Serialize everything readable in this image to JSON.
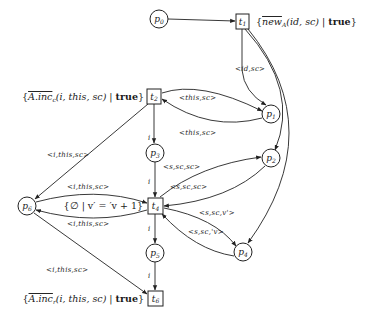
{
  "diagram": {
    "type": "petri-net",
    "places": [
      {
        "id": "p0",
        "label": "p0",
        "sub": "0"
      },
      {
        "id": "p1",
        "label": "p1",
        "sub": "1"
      },
      {
        "id": "p2",
        "label": "p2",
        "sub": "2"
      },
      {
        "id": "p3",
        "label": "p3",
        "sub": "3"
      },
      {
        "id": "p4",
        "label": "p4",
        "sub": "4"
      },
      {
        "id": "p5",
        "label": "p5",
        "sub": "5"
      },
      {
        "id": "p6",
        "label": "p6",
        "sub": "6"
      }
    ],
    "transitions": [
      {
        "id": "t1",
        "sub": "1",
        "guard_pre": "{",
        "guard_name": "new",
        "guard_sub": "A",
        "guard_args": "(id, sc) | ",
        "guard_bool": "true",
        "guard_post": "}"
      },
      {
        "id": "t2",
        "sub": "2",
        "guard_pre": "{",
        "guard_name": "A.inc",
        "guard_sub": "c",
        "guard_args": "(i, this, sc) | ",
        "guard_bool": "true",
        "guard_post": "}"
      },
      {
        "id": "t4",
        "sub": "4",
        "guard_text": "{∅ | v′ = ′v + 1}"
      },
      {
        "id": "t6",
        "sub": "6",
        "guard_pre": "{",
        "guard_name": "A.inc",
        "guard_sub": "r",
        "guard_args": "(i, this, sc) | ",
        "guard_bool": "true",
        "guard_post": "}"
      }
    ],
    "arcs": [
      {
        "from": "p0",
        "to": "t1",
        "label": ""
      },
      {
        "from": "t1",
        "to": "p1",
        "label": "<id,sc>"
      },
      {
        "from": "t1",
        "to": "p2",
        "label": ""
      },
      {
        "from": "t1",
        "to": "p4",
        "label": ""
      },
      {
        "from": "t2",
        "to": "p1",
        "label": "<this,sc>"
      },
      {
        "from": "p1",
        "to": "t2",
        "label": "<this,sc>"
      },
      {
        "from": "t2",
        "to": "p3",
        "label": "i"
      },
      {
        "from": "t2",
        "to": "p6",
        "label": "<i,this,sc>"
      },
      {
        "from": "p3",
        "to": "t4",
        "label": "i"
      },
      {
        "from": "t4",
        "to": "p2",
        "label": "<s,sc,sc>"
      },
      {
        "from": "p2",
        "to": "t4",
        "label": "<s,sc,sc>"
      },
      {
        "from": "p6",
        "to": "t4",
        "label": "<i,this,sc>"
      },
      {
        "from": "t4",
        "to": "p6",
        "label": "<i,this,sc>"
      },
      {
        "from": "t4",
        "to": "p4",
        "label": "<s,sc,v'>"
      },
      {
        "from": "p4",
        "to": "t4",
        "label": "<s,sc,'v>"
      },
      {
        "from": "t4",
        "to": "p5",
        "label": "i"
      },
      {
        "from": "p5",
        "to": "t6",
        "label": "i"
      },
      {
        "from": "p6",
        "to": "t6",
        "label": "<i,this,sc>"
      }
    ]
  }
}
